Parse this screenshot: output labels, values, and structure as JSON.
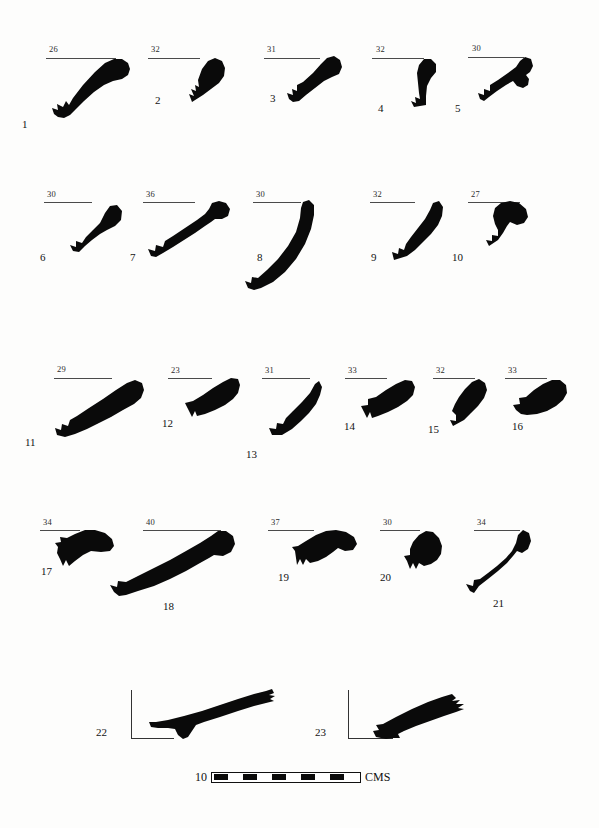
{
  "figure": {
    "kind": "archaeological-pottery-profile-plate",
    "background_color": "#fdfdfc",
    "silhouette_color": "#0a0a0a",
    "rule_color": "#4a4a4a",
    "diameter_unit_note": "rim diameter in cm printed above each profile"
  },
  "scale": {
    "left_label": "10",
    "right_label": "CMS",
    "segment_count": 10,
    "dark_segments": 5
  },
  "caption": {
    "cut_off_text": ""
  },
  "rows": [
    {
      "name": "row-1",
      "items": [
        "1",
        "2",
        "3",
        "4",
        "5"
      ]
    },
    {
      "name": "row-2",
      "items": [
        "6",
        "7",
        "8",
        "9",
        "10"
      ]
    },
    {
      "name": "row-3",
      "items": [
        "11",
        "12",
        "13",
        "14",
        "15",
        "16"
      ]
    },
    {
      "name": "row-4",
      "items": [
        "17",
        "18",
        "19",
        "20",
        "21"
      ]
    },
    {
      "name": "row-5",
      "items": [
        "22",
        "23"
      ]
    }
  ],
  "items": [
    {
      "no": "1",
      "diameter": "26"
    },
    {
      "no": "2",
      "diameter": "32"
    },
    {
      "no": "3",
      "diameter": "31"
    },
    {
      "no": "4",
      "diameter": "32"
    },
    {
      "no": "5",
      "diameter": "30"
    },
    {
      "no": "6",
      "diameter": "30"
    },
    {
      "no": "7",
      "diameter": "36"
    },
    {
      "no": "8",
      "diameter": "30"
    },
    {
      "no": "9",
      "diameter": "32"
    },
    {
      "no": "10",
      "diameter": "27"
    },
    {
      "no": "11",
      "diameter": "29"
    },
    {
      "no": "12",
      "diameter": "23"
    },
    {
      "no": "13",
      "diameter": "31"
    },
    {
      "no": "14",
      "diameter": "33"
    },
    {
      "no": "15",
      "diameter": "32"
    },
    {
      "no": "16",
      "diameter": "33"
    },
    {
      "no": "17",
      "diameter": "34"
    },
    {
      "no": "18",
      "diameter": "40"
    },
    {
      "no": "19",
      "diameter": "37"
    },
    {
      "no": "20",
      "diameter": "30"
    },
    {
      "no": "21",
      "diameter": "34"
    },
    {
      "no": "22",
      "diameter": ""
    },
    {
      "no": "23",
      "diameter": ""
    }
  ]
}
